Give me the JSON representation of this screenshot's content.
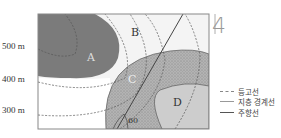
{
  "question_number": "4",
  "elevation_labels": [
    {
      "label": "500 m",
      "y": 47
    },
    {
      "label": "400 m",
      "y": 80
    },
    {
      "label": "300 m",
      "y": 111
    }
  ],
  "strata": [
    {
      "id": "A",
      "label": "A",
      "fill": "#7a7a7a"
    },
    {
      "id": "B",
      "label": "B",
      "fill": "#f2f2f2"
    },
    {
      "id": "C",
      "label": "C",
      "fill": "#b0b0b0",
      "pattern": "dotted"
    },
    {
      "id": "D",
      "label": "D",
      "fill": "#cfcfcf"
    }
  ],
  "angle_label": "60",
  "legend": [
    {
      "style": "dashed",
      "label": "등고선"
    },
    {
      "style": "thin",
      "label": "지층 경계선"
    },
    {
      "style": "thick",
      "label": "주향선"
    }
  ]
}
